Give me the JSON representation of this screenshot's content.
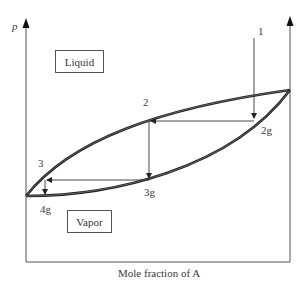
{
  "diagram": {
    "type": "pressure-composition phase diagram (isothermal distillation path)",
    "y_axis_label": "p",
    "x_axis_label": "Mole fraction of A",
    "regions": {
      "liquid": "Liquid",
      "vapor": "Vapor"
    },
    "points": {
      "p1": "1",
      "p2": "2",
      "p2g": "2g",
      "p3": "3",
      "p3g": "3g",
      "p4g": "4g"
    },
    "colors": {
      "curve": "#1a1a1a",
      "axis": "#555555",
      "arrow": "#333333"
    }
  }
}
